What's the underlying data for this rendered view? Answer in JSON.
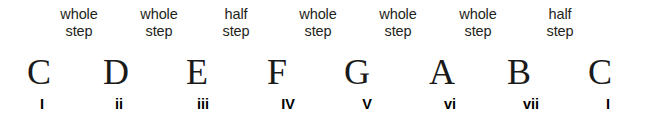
{
  "diagram": {
    "background_color": "#ffffff",
    "text_color": "#231f20"
  },
  "steps": [
    {
      "word": "whole",
      "unit": "step",
      "x": 79
    },
    {
      "word": "whole",
      "unit": "step",
      "x": 159
    },
    {
      "word": "half",
      "unit": "step",
      "x": 236
    },
    {
      "word": "whole",
      "unit": "step",
      "x": 318
    },
    {
      "word": "whole",
      "unit": "step",
      "x": 398
    },
    {
      "word": "whole",
      "unit": "step",
      "x": 478
    },
    {
      "word": "half",
      "unit": "step",
      "x": 560
    }
  ],
  "notes": [
    {
      "letter": "C",
      "x": 39
    },
    {
      "letter": "D",
      "x": 116
    },
    {
      "letter": "E",
      "x": 197
    },
    {
      "letter": "F",
      "x": 277
    },
    {
      "letter": "G",
      "x": 357
    },
    {
      "letter": "A",
      "x": 442
    },
    {
      "letter": "B",
      "x": 519
    },
    {
      "letter": "C",
      "x": 600
    }
  ],
  "numerals": [
    {
      "label": "I",
      "x": 42
    },
    {
      "label": "ii",
      "x": 119
    },
    {
      "label": "iii",
      "x": 203
    },
    {
      "label": "IV",
      "x": 288
    },
    {
      "label": "V",
      "x": 367
    },
    {
      "label": "vi",
      "x": 450
    },
    {
      "label": "vii",
      "x": 531
    },
    {
      "label": "I",
      "x": 608
    }
  ]
}
